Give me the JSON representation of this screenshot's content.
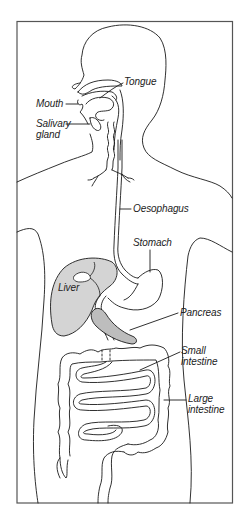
{
  "diagram": {
    "type": "anatomical-illustration",
    "colors": {
      "line": "#1a1a1a",
      "frame": "#555555",
      "liver_fill": "#cfcfcf",
      "pancreas_fill": "#b8b8b8",
      "background": "#ffffff"
    },
    "labels": {
      "tongue": "Tongue",
      "mouth": "Mouth",
      "salivary_gland": {
        "line1": "Salivary",
        "line2": "gland"
      },
      "oesophagus": "Oesophagus",
      "stomach": "Stomach",
      "liver": "Liver",
      "pancreas": "Pancreas",
      "small_intestine": {
        "line1": "Small",
        "line2": "intestine"
      },
      "large_intestine": {
        "line1": "Large",
        "line2": "intestine"
      }
    }
  }
}
